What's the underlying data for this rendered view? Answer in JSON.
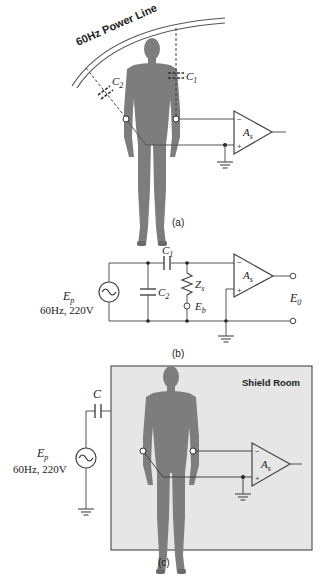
{
  "panel_a": {
    "caption": "(a)",
    "power_line_label": "60Hz Power Line",
    "capacitor_c1": {
      "main": "C",
      "sub": "1"
    },
    "capacitor_c2": {
      "main": "C",
      "sub": "2"
    },
    "amplifier": {
      "main": "A",
      "sub": "s",
      "minus": "−",
      "plus": "+"
    }
  },
  "panel_b": {
    "caption": "(b)",
    "source": {
      "main": "E",
      "sub": "p",
      "spec": "60Hz, 220V"
    },
    "capacitor_c1": {
      "main": "C",
      "sub": "1"
    },
    "capacitor_c2": {
      "main": "C",
      "sub": "2"
    },
    "impedance": {
      "main": "Z",
      "sub": "s"
    },
    "body_node": {
      "main": "E",
      "sub": "b"
    },
    "output": {
      "main": "E",
      "sub": "0"
    },
    "amplifier": {
      "main": "A",
      "sub": "s",
      "minus": "−",
      "plus": "+"
    }
  },
  "panel_c": {
    "caption": "(c)",
    "room_label": "Shield Room",
    "capacitor": {
      "main": "C"
    },
    "source": {
      "main": "E",
      "sub": "p",
      "spec": "60Hz, 220V"
    },
    "amplifier": {
      "main": "A",
      "sub": "s",
      "minus": "−",
      "plus": "+"
    }
  },
  "colors": {
    "line": "#555555",
    "body": "#7d7d7d",
    "shield_fill": "#e6e6e6",
    "text": "#222222"
  }
}
